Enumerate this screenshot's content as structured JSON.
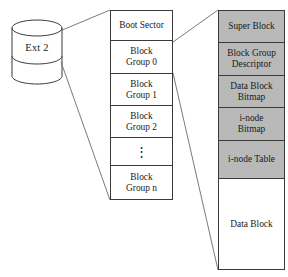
{
  "diagram": {
    "colors": {
      "shaded_fill": "#b9b9b9",
      "line": "#3a3a3a",
      "background": "#ffffff",
      "text": "#1a1a1a"
    },
    "disk": {
      "label": "Ext 2",
      "shape": "cylinder"
    },
    "partition_column": {
      "cells": [
        {
          "label": "Boot Sector",
          "shaded": false,
          "kind": "text"
        },
        {
          "label": "Block\nGroup 0",
          "shaded": false,
          "kind": "text"
        },
        {
          "label": "Block\nGroup 1",
          "shaded": false,
          "kind": "text"
        },
        {
          "label": "Block\nGroup 2",
          "shaded": false,
          "kind": "text"
        },
        {
          "label": "⋮",
          "shaded": false,
          "kind": "ellipsis"
        },
        {
          "label": "Block\nGroup n",
          "shaded": false,
          "kind": "text"
        }
      ]
    },
    "block_group_column": {
      "cells": [
        {
          "label": "Super Block",
          "shaded": true,
          "kind": "text"
        },
        {
          "label": "Block Group\nDescriptor",
          "shaded": true,
          "kind": "text"
        },
        {
          "label": "Data Block\nBitmap",
          "shaded": true,
          "kind": "text"
        },
        {
          "label": "i-node\nBitmap",
          "shaded": true,
          "kind": "text"
        },
        {
          "label": "i-node Table",
          "shaded": true,
          "kind": "text"
        },
        {
          "label": "Data Block",
          "shaded": false,
          "kind": "text"
        }
      ]
    }
  }
}
